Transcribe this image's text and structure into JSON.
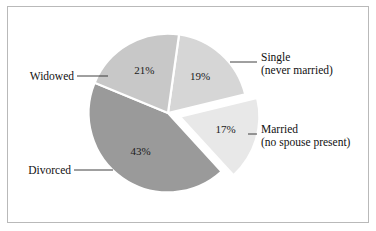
{
  "figure": {
    "border_color": "#b9b9b9",
    "background": "#ffffff"
  },
  "chart_data": {
    "type": "pie",
    "title": "",
    "subtitle": "",
    "xlabel": "",
    "ylabel": "",
    "legend_position": "callout-labels",
    "grid": false,
    "units": "percent",
    "total": 100,
    "categories": [
      "Single (never married)",
      "Married (no spouse present)",
      "Divorced",
      "Widowed"
    ],
    "values": [
      19,
      17,
      43,
      21
    ],
    "slices": [
      {
        "label_line1": "Single",
        "label_line2": "(never married)",
        "value": 19,
        "value_text": "19%",
        "color": "#d6d6d6",
        "exploded": false,
        "callout_side": "right"
      },
      {
        "label_line1": "Married",
        "label_line2": "(no spouse present)",
        "value": 17,
        "value_text": "17%",
        "color": "#e8e8e8",
        "exploded": true,
        "callout_side": "right"
      },
      {
        "label_line1": "Divorced",
        "label_line2": "",
        "value": 43,
        "value_text": "43%",
        "color": "#9a9a9a",
        "exploded": false,
        "callout_side": "left"
      },
      {
        "label_line1": "Widowed",
        "label_line2": "",
        "value": 21,
        "value_text": "21%",
        "color": "#c8c8c8",
        "exploded": false,
        "callout_side": "left"
      }
    ]
  }
}
